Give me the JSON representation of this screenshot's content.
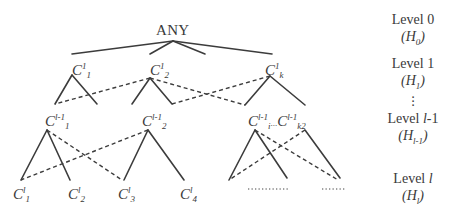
{
  "diagram": {
    "type": "hierarchy-tree",
    "root": {
      "label": "ANY"
    },
    "level1_nodes": [
      {
        "base": "C",
        "sup": "1",
        "sub": "1"
      },
      {
        "base": "C",
        "sup": "1",
        "sub": "2"
      },
      {
        "base": "C",
        "sup": "1",
        "sub": "k"
      }
    ],
    "level_l_minus_1_nodes": [
      {
        "base": "C",
        "sup": "l-1",
        "sub": "1"
      },
      {
        "base": "C",
        "sup": "l-1",
        "sub": "2"
      },
      {
        "base": "C",
        "sup": "l-1",
        "sub": "i",
        "ellipsis": "...",
        "base2": "C",
        "sup2": "l-1",
        "sub2": "k2"
      }
    ],
    "level_l_nodes": [
      {
        "base": "C",
        "sup": "l",
        "sub": "1"
      },
      {
        "base": "C",
        "sup": "l",
        "sub": "2"
      },
      {
        "base": "C",
        "sup": "l",
        "sub": "3"
      },
      {
        "base": "C",
        "sup": "l",
        "sub": "4"
      }
    ],
    "level_l_placeholders": [
      ".........",
      "......"
    ],
    "levels": [
      {
        "label": "Level 0",
        "h_base": "H",
        "h_sub": "0"
      },
      {
        "label": "Level 1",
        "h_base": "H",
        "h_sub": "1"
      },
      {
        "label": "Level l-1",
        "label_prefix": "Level ",
        "label_var": "l",
        "label_suffix": "-1",
        "h_base": "H",
        "h_sub": "l-1"
      },
      {
        "label": "Level l",
        "label_prefix": "Level ",
        "label_var": "l",
        "label_suffix": "",
        "h_base": "H",
        "h_sub": "l"
      }
    ],
    "vertical_ellipsis": "⋮",
    "edge_styles": {
      "solid": "is-a (primary parent)",
      "dashed": "multiple inheritance link"
    }
  }
}
